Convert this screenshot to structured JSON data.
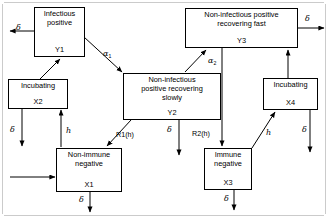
{
  "diagram": {
    "kind": "compartmental-flow-diagram",
    "frame_color": "#c9c9c9",
    "line_color": "#000000",
    "background": "#ffffff",
    "nodes": [
      {
        "id": "Y1",
        "name": "infectious-positive",
        "title": "Infectious\npositive",
        "code": "Y1",
        "x": 34,
        "y": 7,
        "w": 51,
        "h": 50
      },
      {
        "id": "X2",
        "name": "incubating-x2",
        "title": "Incubating",
        "code": "X2",
        "x": 8,
        "y": 79,
        "w": 60,
        "h": 30
      },
      {
        "id": "X1",
        "name": "non-immune-negative",
        "title": "Non-immune\nnegative",
        "code": "X1",
        "x": 56,
        "y": 148,
        "w": 66,
        "h": 44
      },
      {
        "id": "Y2",
        "name": "non-infectious-positive-recovering-slowly",
        "title": "Non-infectious\npositive recovering\nslowly",
        "code": "Y2",
        "x": 123,
        "y": 73,
        "w": 98,
        "h": 47
      },
      {
        "id": "Y3",
        "name": "non-infectious-positive-recovering-fast",
        "title": "Non-infectious positive\nrecovering fast",
        "code": "Y3",
        "x": 185,
        "y": 8,
        "w": 113,
        "h": 40
      },
      {
        "id": "X4",
        "name": "incubating-x4",
        "title": "Incubating",
        "code": "X4",
        "x": 263,
        "y": 78,
        "w": 55,
        "h": 32
      },
      {
        "id": "X3",
        "name": "immune-negative",
        "title": "Immune\nnegative",
        "code": "X3",
        "x": 204,
        "y": 148,
        "w": 48,
        "h": 42
      }
    ],
    "edge_labels": [
      {
        "id": "delta-y1",
        "name": "delta-label-y1-outflow",
        "text": "δ",
        "x": 16,
        "y": 24,
        "style": "greek"
      },
      {
        "id": "alpha1",
        "name": "alpha1-label",
        "text": "α",
        "sub": "1",
        "x": 103,
        "y": 50,
        "style": "sub"
      },
      {
        "id": "alpha2",
        "name": "alpha2-label",
        "text": "α",
        "sub": "2",
        "x": 208,
        "y": 57,
        "style": "sub"
      },
      {
        "id": "delta-y3",
        "name": "delta-label-y3-outflow",
        "text": "δ",
        "x": 305,
        "y": 15,
        "style": "greek"
      },
      {
        "id": "delta-x2",
        "name": "delta-label-x2-outflow",
        "text": "δ",
        "x": 10,
        "y": 126,
        "style": "greek"
      },
      {
        "id": "h-x2",
        "name": "h-label-x2-to-x1",
        "text": "h",
        "x": 66,
        "y": 129,
        "style": "ital"
      },
      {
        "id": "r1h",
        "name": "r1h-label",
        "text": "R1(h)",
        "x": 116,
        "y": 131,
        "style": "plain"
      },
      {
        "id": "delta-y2",
        "name": "delta-label-y2-outflow",
        "text": "δ",
        "x": 167,
        "y": 126,
        "style": "greek"
      },
      {
        "id": "r2h",
        "name": "r2h-label",
        "text": "R2(h)",
        "x": 192,
        "y": 130,
        "style": "plain"
      },
      {
        "id": "h-x4",
        "name": "h-label-x4-to-x3",
        "text": "h",
        "x": 266,
        "y": 131,
        "style": "ital"
      },
      {
        "id": "delta-x4",
        "name": "delta-label-x4-outflow",
        "text": "δ",
        "x": 302,
        "y": 126,
        "style": "greek"
      },
      {
        "id": "delta-x1",
        "name": "delta-label-x1-outflow",
        "text": "δ",
        "x": 79,
        "y": 196,
        "style": "greek"
      },
      {
        "id": "delta-x3",
        "name": "delta-label-x3-outflow",
        "text": "δ",
        "x": 224,
        "y": 196,
        "style": "greek"
      }
    ],
    "edges": [
      {
        "id": "y1-to-delta",
        "name": "edge-y1-to-outflow",
        "from": "Y1",
        "to": "outflow-left"
      },
      {
        "id": "x2-to-y1",
        "name": "edge-x2-to-y1",
        "from": "X2",
        "to": "Y1"
      },
      {
        "id": "y1-to-y2",
        "name": "edge-y1-to-y2-alpha1",
        "from": "Y1",
        "to": "Y2"
      },
      {
        "id": "y2-to-y3",
        "name": "edge-y2-to-y3-alpha2",
        "from": "Y2",
        "to": "Y3"
      },
      {
        "id": "y3-to-delta",
        "name": "edge-y3-to-outflow",
        "from": "Y3",
        "to": "outflow-right"
      },
      {
        "id": "x2-to-outflow",
        "name": "edge-x2-to-outflow",
        "from": "X2",
        "to": "outflow-down"
      },
      {
        "id": "x2-to-x1",
        "name": "edge-x2-to-x1-h",
        "from": "X2",
        "to": "X1"
      },
      {
        "id": "y2-to-x1",
        "name": "edge-y2-to-x1-r1h",
        "from": "Y2",
        "to": "X1"
      },
      {
        "id": "y2-to-outflow",
        "name": "edge-y2-to-outflow",
        "from": "Y2",
        "to": "outflow-down"
      },
      {
        "id": "y3-to-x3",
        "name": "edge-y3-to-x3-r2h",
        "from": "Y3",
        "to": "X3"
      },
      {
        "id": "x4-to-y3",
        "name": "edge-x4-to-y3",
        "from": "X4",
        "to": "Y3"
      },
      {
        "id": "x3-to-x4",
        "name": "edge-x3-to-x4-h",
        "from": "X3",
        "to": "X4"
      },
      {
        "id": "x4-to-outflow",
        "name": "edge-x4-to-outflow",
        "from": "X4",
        "to": "outflow-down"
      },
      {
        "id": "x1-to-outflow",
        "name": "edge-x1-to-outflow",
        "from": "X1",
        "to": "outflow-down"
      },
      {
        "id": "x3-to-outflow",
        "name": "edge-x3-to-outflow",
        "from": "X3",
        "to": "outflow-down"
      },
      {
        "id": "inflow-to-x1",
        "name": "edge-inflow-to-x1",
        "from": "inflow-left",
        "to": "X1"
      }
    ]
  }
}
